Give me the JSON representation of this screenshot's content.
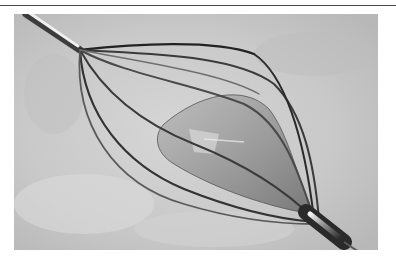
{
  "figure": {
    "alt": "Basket catheter device photograph"
  },
  "colors": {
    "background": "#ffffff",
    "rule": "#4a4a4a",
    "tissue": "#cfcfcf",
    "tissue_dark": "#b2b2b2",
    "wire": "#3a3a3a",
    "wire_light": "#6e6e6e",
    "membrane": "#8c8c8c",
    "shaft": "#2a2a2a",
    "highlight": "#f2f2f2"
  }
}
